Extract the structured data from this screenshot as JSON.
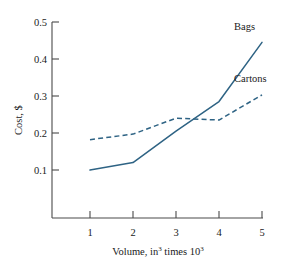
{
  "chart_data": {
    "type": "line",
    "title": "",
    "xlabel": "Volume, in3 times 103",
    "xlabel_parts": {
      "lead": "Volume, in",
      "sup1": "3",
      "mid": " times 10",
      "sup2": "3"
    },
    "ylabel": "Cost, $",
    "xlim": [
      0.6,
      5.2
    ],
    "ylim": [
      0.0,
      0.52
    ],
    "xticks": [
      1,
      2,
      3,
      4,
      5
    ],
    "xtick_labels": [
      "1",
      "2",
      "3",
      "4",
      "5"
    ],
    "yticks": [
      0.1,
      0.2,
      0.3,
      0.4,
      0.5
    ],
    "ytick_labels": [
      "0.1",
      "0.2",
      "0.3",
      "0.4",
      "0.5"
    ],
    "grid": false,
    "legend_position": "inline-annotations",
    "line_color": "#2e6384",
    "x": [
      1,
      2,
      3,
      4,
      5
    ],
    "series": [
      {
        "name": "Bags",
        "style": "solid",
        "values": [
          0.1,
          0.12,
          0.205,
          0.285,
          0.445
        ],
        "label": "Bags",
        "label_x": 4.35,
        "label_y": 0.478
      },
      {
        "name": "Cartons",
        "style": "dashed",
        "values": [
          0.182,
          0.197,
          0.24,
          0.235,
          0.303
        ],
        "label": "Cartons",
        "label_x": 4.35,
        "label_y": 0.338
      }
    ]
  }
}
